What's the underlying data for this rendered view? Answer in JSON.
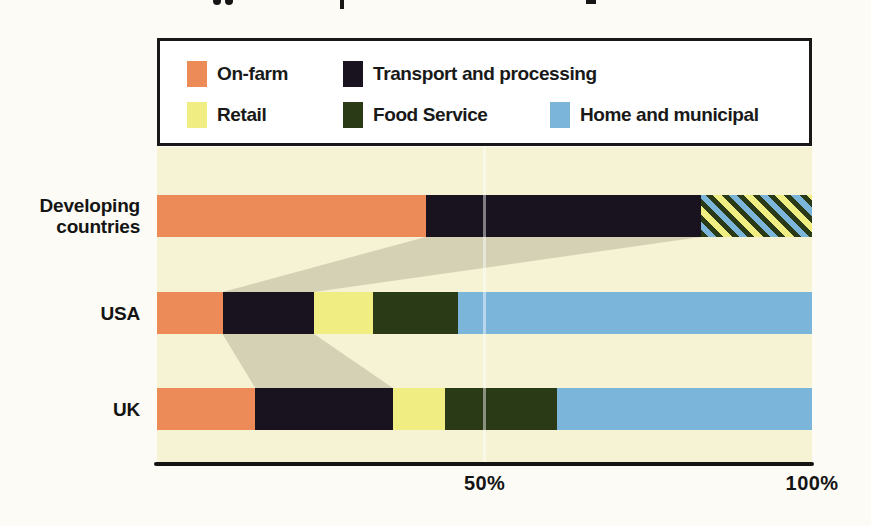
{
  "page_background": "#fcfbf5",
  "colors": {
    "plot_background": "#f6f2d4",
    "on_farm": "#ec8a58",
    "transport": "#18131f",
    "retail": "#f0ee83",
    "food_service": "#2a3a16",
    "home": "#7cb5da",
    "gridline": "rgba(255,255,255,0.45)",
    "axis": "#141414",
    "connector_wedge": "rgba(128,126,100,0.28)",
    "legend_border": "#191919",
    "legend_background": "#ffffff"
  },
  "legend": {
    "items": [
      {
        "label": "On-farm",
        "color_key": "on_farm"
      },
      {
        "label": "Transport and processing",
        "color_key": "transport"
      },
      {
        "label": "Retail",
        "color_key": "retail"
      },
      {
        "label": "Food Service",
        "color_key": "food_service"
      },
      {
        "label": "Home and municipal",
        "color_key": "home"
      }
    ]
  },
  "chart_data": {
    "type": "bar",
    "subtype": "horizontal-stacked",
    "title": "",
    "categories": [
      "Developing countries",
      "USA",
      "UK"
    ],
    "series": [
      {
        "name": "On-farm",
        "color_key": "on_farm",
        "values": [
          41,
          10,
          15
        ]
      },
      {
        "name": "Transport and processing",
        "color_key": "transport",
        "values": [
          42,
          14,
          21
        ]
      },
      {
        "name": "Retail",
        "color_key": "retail",
        "values": [
          0,
          9,
          8
        ]
      },
      {
        "name": "Food Service",
        "color_key": "food_service",
        "values": [
          0,
          13,
          17
        ]
      },
      {
        "name": "Home and municipal",
        "color_key": "home",
        "values": [
          0,
          54,
          39
        ]
      },
      {
        "name": "Retail, Food Service, Home (hatched mix)",
        "color_key": "hatch",
        "values": [
          17,
          0,
          0
        ]
      }
    ],
    "x_axis": {
      "min": 0,
      "max": 100,
      "ticks": [
        {
          "label": "50%",
          "value": 50
        },
        {
          "label": "100%",
          "value": 100
        }
      ],
      "gridlines": [
        50
      ]
    },
    "legend_position": "top",
    "connectors": [
      {
        "from_row": 0,
        "to_row": 1,
        "series": "Transport and processing"
      },
      {
        "from_row": 1,
        "to_row": 2,
        "series": "Transport and processing"
      }
    ]
  }
}
